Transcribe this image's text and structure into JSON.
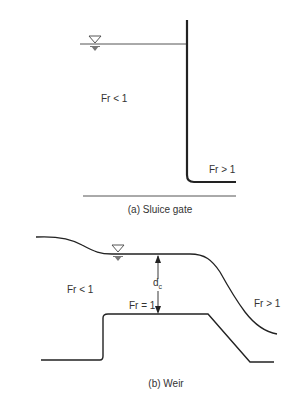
{
  "panel_a": {
    "caption": "(a) Sluice gate",
    "upstream_label": "Fr < 1",
    "downstream_label": "Fr > 1"
  },
  "panel_b": {
    "caption": "(b) Weir",
    "upstream_label": "Fr < 1",
    "crest_label": "Fr = 1",
    "downstream_label": "Fr > 1",
    "depth_label": "d",
    "depth_subscript": "c"
  },
  "colors": {
    "line": "#2a2a2a",
    "water_symbol": "#777777"
  }
}
